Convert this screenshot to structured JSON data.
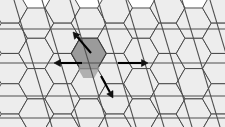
{
  "figure": {
    "width": 225,
    "height": 127,
    "background_color": "#ffffff"
  },
  "colors": {
    "background": "#ffffff",
    "hexagon_fill": "#ededed",
    "hexagon_stroke": "#4a4a4a",
    "highlight_fill": "#9b9b9b",
    "highlight_stroke": "#3a3a3a",
    "grid_line": "#4f4f4f",
    "arrow_fill": "#111111",
    "arrow_stroke": "#000000"
  },
  "lattice": {
    "name": "honeycomb-hex-grid",
    "orientation": "flat-top",
    "hex_radius": 17.5,
    "columns": 9,
    "rows": 6,
    "origin_x": 10,
    "origin_y": 8,
    "col_step": 26.25,
    "row_step": 30.3,
    "row_offset": 15.15,
    "stroke_width": 1.0
  },
  "highlight_cell": {
    "name": "deformed-unit-cell",
    "center_x": 99,
    "center_y": 63,
    "label": "shaded central cell",
    "fill": "#9b9b9b"
  },
  "reference_grid": {
    "horizontal_lines": {
      "name": "horizontal-grid-lines",
      "count": 4,
      "y_positions": [
        29,
        63,
        96,
        118
      ],
      "x_start": 0,
      "x_end": 225,
      "stroke_width": 1.1
    },
    "diagonal_lines": {
      "name": "diagonal-grid-lines",
      "count": 9,
      "slope_dx": 38,
      "slope_dy": 127,
      "x_intercepts_at_top": [
        14,
        42,
        70,
        98,
        126,
        154,
        182,
        210,
        238
      ],
      "stroke_width": 1.1
    }
  },
  "arrows": [
    {
      "name": "arrow-up-left",
      "direction": "up-left",
      "from_x": 91,
      "from_y": 53,
      "to_x": 73,
      "to_y": 32,
      "head_size": 6.5
    },
    {
      "name": "arrow-left",
      "direction": "left",
      "from_x": 82,
      "from_y": 63,
      "to_x": 54,
      "to_y": 63,
      "head_size": 6.5
    },
    {
      "name": "arrow-right",
      "direction": "right",
      "from_x": 118,
      "from_y": 63,
      "to_x": 148,
      "to_y": 63,
      "head_size": 6.5
    },
    {
      "name": "arrow-down-right",
      "direction": "down-right",
      "from_x": 101,
      "from_y": 76,
      "to_x": 113,
      "to_y": 98,
      "head_size": 6.5
    }
  ]
}
